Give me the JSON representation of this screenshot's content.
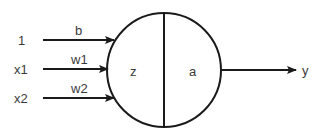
{
  "diagram": {
    "type": "neuron",
    "inputs": [
      {
        "label": "1",
        "weight": "b"
      },
      {
        "label": "x1",
        "weight": "w1"
      },
      {
        "label": "x2",
        "weight": "w2"
      }
    ],
    "neuron": {
      "left_label": "z",
      "right_label": "a"
    },
    "output": {
      "label": "y"
    },
    "colors": {
      "stroke": "#1a1a1a",
      "text": "#3a3a3a",
      "background": "#ffffff"
    }
  }
}
